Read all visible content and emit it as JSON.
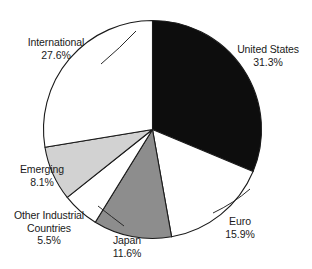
{
  "chart_data": {
    "type": "pie",
    "title": "",
    "subtitle": "",
    "xlabel": "",
    "ylabel": "",
    "legend_position": "none",
    "grid": false,
    "start_angle_deg": 0,
    "direction": "clockwise",
    "unit": "%",
    "categories": [
      "United States",
      "Euro",
      "Japan",
      "Other Industrial Countries",
      "Emerging",
      "International"
    ],
    "values": [
      31.3,
      15.9,
      11.6,
      5.5,
      8.1,
      27.6
    ],
    "slices": [
      {
        "label": "United States",
        "label_line1": "United States",
        "value": 31.3,
        "value_text": "31.3%",
        "color": "#0d0d0d",
        "start_deg": 0.0,
        "end_deg": 112.68
      },
      {
        "label": "Euro",
        "label_line1": "Euro",
        "value": 15.9,
        "value_text": "15.9%",
        "color": "#ffffff",
        "start_deg": 112.68,
        "end_deg": 169.92
      },
      {
        "label": "Japan",
        "label_line1": "Japan",
        "value": 11.6,
        "value_text": "11.6%",
        "color": "#8d8d8d",
        "start_deg": 169.92,
        "end_deg": 211.68
      },
      {
        "label": "Other Industrial Countries",
        "label_line1": "Other Industrial",
        "label_line2": "Countries",
        "value": 5.5,
        "value_text": "5.5%",
        "color": "#ffffff",
        "start_deg": 211.68,
        "end_deg": 231.48
      },
      {
        "label": "Emerging",
        "label_line1": "Emerging",
        "value": 8.1,
        "value_text": "8.1%",
        "color": "#d2d2d2",
        "start_deg": 231.48,
        "end_deg": 260.64
      },
      {
        "label": "International",
        "label_line1": "International",
        "value": 27.6,
        "value_text": "27.6%",
        "color": "#ffffff",
        "start_deg": 260.64,
        "end_deg": 360.0
      }
    ],
    "total": 100.0,
    "colors": {
      "united_states": "#0d0d0d",
      "euro": "#ffffff",
      "japan": "#8d8d8d",
      "other_industrial_countries": "#ffffff",
      "emerging": "#d2d2d2",
      "international": "#ffffff",
      "outline": "#1a1a1a",
      "background": "#ffffff",
      "text": "#1a1a1a"
    }
  }
}
